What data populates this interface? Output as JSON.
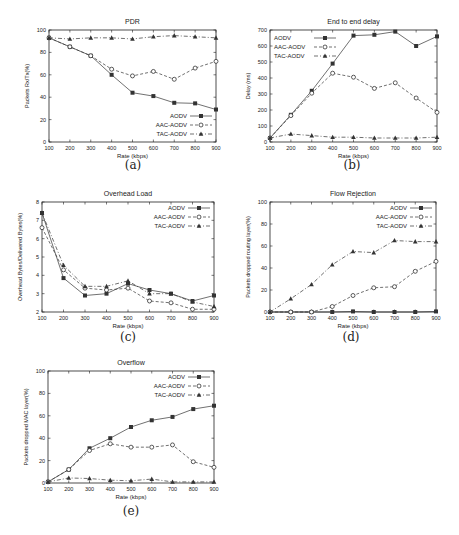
{
  "figure": {
    "captions": [
      "(a)",
      "(b)",
      "(c)",
      "(d)",
      "(e)"
    ]
  },
  "series_styles": {
    "AODV": {
      "marker": "square-filled",
      "dash": "none",
      "color": "#333333"
    },
    "AAC-AODV": {
      "marker": "circle-open",
      "dash": "3,2",
      "color": "#333333"
    },
    "TAC-AODV": {
      "marker": "triangle-filled",
      "dash": "4,2,1,2",
      "color": "#333333"
    }
  },
  "chart_data": [
    {
      "id": "a",
      "type": "line",
      "title": "PDR",
      "xlabel": "Rate (kbps)",
      "ylabel": "Packets Rx/Tx(%)",
      "x": [
        100,
        200,
        300,
        400,
        500,
        600,
        700,
        800,
        900
      ],
      "xticks": [
        100,
        200,
        300,
        400,
        500,
        600,
        700,
        800,
        900
      ],
      "yticks": [
        0,
        20,
        40,
        60,
        80,
        100
      ],
      "ylim": [
        0,
        100
      ],
      "grid": false,
      "legend_position": "lower right",
      "series": [
        {
          "name": "AODV",
          "values": [
            93,
            85,
            77,
            60,
            44,
            41,
            35,
            34.5,
            29
          ]
        },
        {
          "name": "AAC-AODV",
          "values": [
            93,
            85,
            77,
            65,
            59,
            63,
            56,
            66,
            72
          ]
        },
        {
          "name": "TAC-AODV",
          "values": [
            93,
            92,
            93,
            93,
            92,
            94,
            95,
            94,
            93
          ]
        }
      ]
    },
    {
      "id": "b",
      "type": "line",
      "title": "End to end delay",
      "xlabel": "Rate (kbps)",
      "ylabel": "Delay (ms)",
      "x": [
        100,
        200,
        300,
        400,
        500,
        600,
        700,
        800,
        900
      ],
      "xticks": [
        100,
        200,
        300,
        400,
        500,
        600,
        700,
        800,
        900
      ],
      "yticks": [
        0,
        100,
        200,
        300,
        400,
        500,
        600,
        700
      ],
      "ylim": [
        0,
        700
      ],
      "grid": false,
      "legend_position": "upper left",
      "series": [
        {
          "name": "AODV",
          "values": [
            25,
            170,
            320,
            490,
            665,
            670,
            690,
            600,
            660
          ]
        },
        {
          "name": "AAC-AODV",
          "values": [
            25,
            165,
            305,
            430,
            405,
            335,
            370,
            275,
            185
          ]
        },
        {
          "name": "TAC-AODV",
          "values": [
            25,
            50,
            40,
            30,
            30,
            25,
            25,
            25,
            30
          ]
        }
      ]
    },
    {
      "id": "c",
      "type": "line",
      "title": "Overhead Load",
      "xlabel": "Rate (kbps)",
      "ylabel": "Overhead Bytes/Delivered Bytes(%)",
      "x": [
        100,
        200,
        300,
        400,
        500,
        600,
        700,
        800,
        900
      ],
      "xticks": [
        100,
        200,
        300,
        400,
        500,
        600,
        700,
        800,
        900
      ],
      "yticks": [
        2,
        3,
        4,
        5,
        6,
        7,
        8
      ],
      "ylim": [
        2,
        8
      ],
      "grid": false,
      "legend_position": "upper right",
      "series": [
        {
          "name": "AODV",
          "values": [
            7.4,
            3.85,
            2.9,
            3.0,
            3.55,
            3.2,
            3.0,
            2.6,
            2.9
          ]
        },
        {
          "name": "AAC-AODV",
          "values": [
            6.6,
            4.3,
            3.3,
            3.2,
            3.3,
            2.6,
            2.5,
            2.15,
            2.15
          ]
        },
        {
          "name": "TAC-AODV",
          "values": [
            7.4,
            4.55,
            3.4,
            3.4,
            3.7,
            3.0,
            3.0,
            2.55,
            2.3
          ]
        }
      ]
    },
    {
      "id": "d",
      "type": "line",
      "title": "Flow Rejection",
      "xlabel": "Rate (kbps)",
      "ylabel": "Packets dropped routing layer(%)",
      "x": [
        100,
        200,
        300,
        400,
        500,
        600,
        700,
        800,
        900
      ],
      "xticks": [
        100,
        200,
        300,
        400,
        500,
        600,
        700,
        800,
        900
      ],
      "yticks": [
        0,
        20,
        40,
        60,
        80,
        100
      ],
      "ylim": [
        0,
        100
      ],
      "grid": false,
      "legend_position": "upper right",
      "series": [
        {
          "name": "AODV",
          "values": [
            0,
            0,
            0,
            0,
            0.5,
            0,
            0,
            0,
            0.5
          ]
        },
        {
          "name": "AAC-AODV",
          "values": [
            0,
            0,
            0,
            5,
            15,
            22,
            23,
            37,
            46
          ]
        },
        {
          "name": "TAC-AODV",
          "values": [
            0,
            12,
            25,
            43,
            55,
            54,
            65,
            64,
            64
          ]
        }
      ]
    },
    {
      "id": "e",
      "type": "line",
      "title": "Overflow",
      "xlabel": "Rate (kbps)",
      "ylabel": "Packets dropped MAC layer(%)",
      "x": [
        100,
        200,
        300,
        400,
        500,
        600,
        700,
        800,
        900
      ],
      "xticks": [
        100,
        200,
        300,
        400,
        500,
        600,
        700,
        800,
        900
      ],
      "yticks": [
        0,
        20,
        40,
        60,
        80,
        100
      ],
      "ylim": [
        0,
        100
      ],
      "grid": false,
      "legend_position": "upper right",
      "series": [
        {
          "name": "AODV",
          "values": [
            1,
            12,
            31,
            40,
            50,
            56,
            59,
            66,
            69
          ]
        },
        {
          "name": "AAC-AODV",
          "values": [
            1,
            12,
            29,
            35,
            32,
            32,
            34,
            19,
            14
          ]
        },
        {
          "name": "TAC-AODV",
          "values": [
            1,
            4.5,
            4,
            2.5,
            2,
            3.5,
            1,
            1,
            1
          ]
        }
      ]
    }
  ]
}
